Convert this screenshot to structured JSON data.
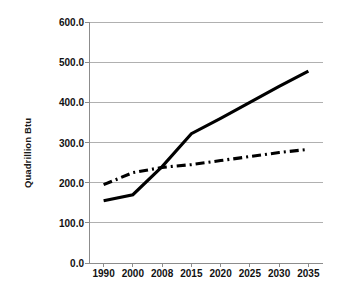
{
  "chart_data": {
    "type": "line",
    "title": "",
    "xlabel": "",
    "ylabel": "Quadrillion Btu",
    "categories": [
      "1990",
      "2000",
      "2008",
      "2015",
      "2020",
      "2025",
      "2030",
      "2035"
    ],
    "ylim": [
      0,
      600
    ],
    "ytick_labels": [
      "0.0",
      "100.0",
      "200.0",
      "300.0",
      "400.0",
      "500.0",
      "600.0"
    ],
    "ytick_values": [
      0,
      100,
      200,
      300,
      400,
      500,
      600
    ],
    "grid": true,
    "grid_axis": "y",
    "legend": false,
    "legend_position": "none",
    "series": [
      {
        "name": "series-solid",
        "style": "solid",
        "color": "#000000",
        "width": 3.1,
        "values": [
          155,
          170,
          240,
          322,
          360,
          400,
          440,
          478
        ]
      },
      {
        "name": "series-dash-dot",
        "style": "dash-dot",
        "color": "#000000",
        "width": 3.1,
        "values": [
          195,
          225,
          238,
          245,
          255,
          265,
          275,
          283
        ]
      }
    ]
  },
  "axes": {
    "axis_color": "#8c8c8c",
    "grid_color": "#b0b0b0",
    "tick_color": "#8c8c8c"
  },
  "plot_area": {
    "left": 89,
    "right": 323,
    "top": 22,
    "bottom": 263
  }
}
